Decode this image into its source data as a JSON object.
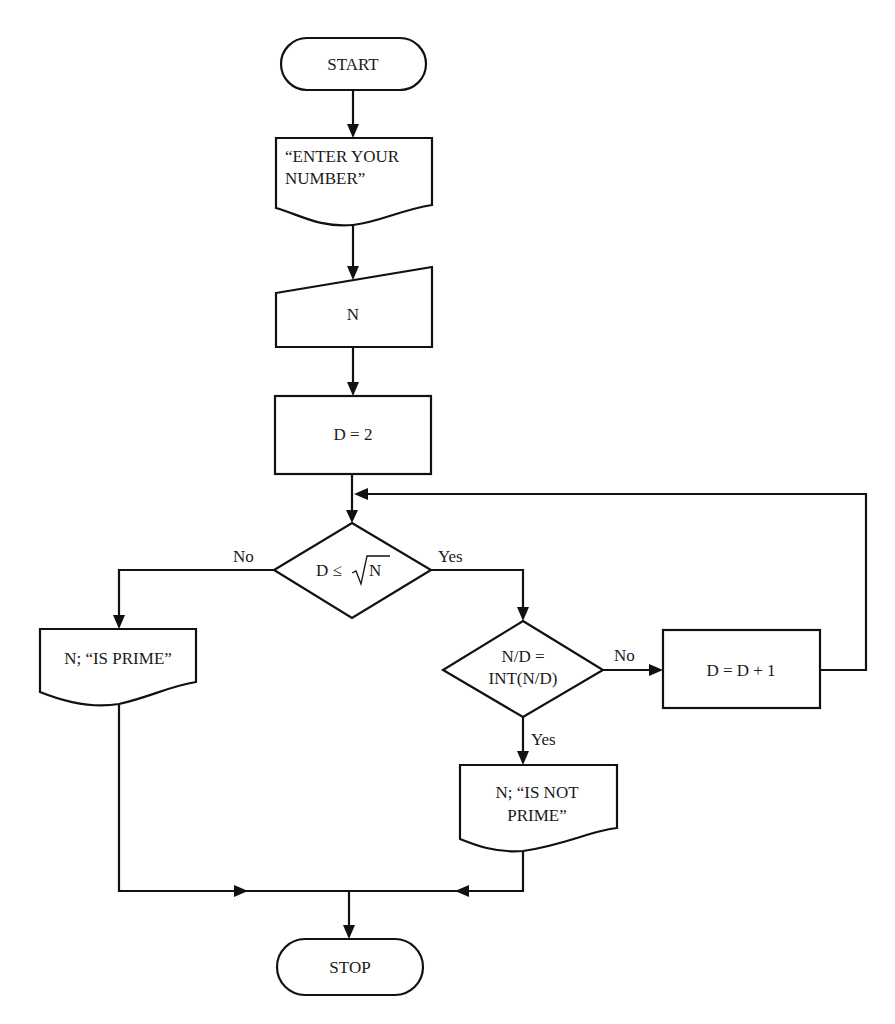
{
  "diagram": {
    "type": "flowchart",
    "title": "",
    "nodes": {
      "start": {
        "shape": "terminator",
        "label": "START"
      },
      "prompt": {
        "shape": "document",
        "line1": "“ENTER YOUR",
        "line2": "NUMBER”"
      },
      "input_n": {
        "shape": "manual-input",
        "label": "N"
      },
      "init_d": {
        "shape": "process",
        "label": "D = 2"
      },
      "cond_sqrt": {
        "shape": "decision",
        "label_prefix": "D ≤ ",
        "label_radical": "√",
        "label_radicand": "N"
      },
      "print_prime": {
        "shape": "document",
        "label": "N; “IS PRIME”"
      },
      "cond_int": {
        "shape": "decision",
        "line1": "N/D =",
        "line2": "INT(N/D)"
      },
      "increment": {
        "shape": "process",
        "label": "D = D + 1"
      },
      "print_not_prime": {
        "shape": "document",
        "line1": "N; “IS NOT",
        "line2": "PRIME”"
      },
      "stop": {
        "shape": "terminator",
        "label": "STOP"
      }
    },
    "edge_labels": {
      "cond_sqrt_no": "No",
      "cond_sqrt_yes": "Yes",
      "cond_int_no": "No",
      "cond_int_yes": "Yes"
    },
    "colors": {
      "stroke": "#111111",
      "text": "#1a1a1a",
      "background": "#ffffff"
    }
  }
}
